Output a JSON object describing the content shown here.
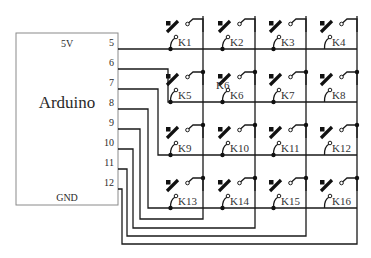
{
  "arduino": {
    "title": "Arduino",
    "top_label": "5V",
    "bottom_label": "GND",
    "box": {
      "x": 16,
      "y": 33,
      "w": 102,
      "h": 172
    },
    "pins": [
      {
        "label": "5",
        "y": 49
      },
      {
        "label": "6",
        "y": 69
      },
      {
        "label": "7",
        "y": 89
      },
      {
        "label": "8",
        "y": 109
      },
      {
        "label": "9",
        "y": 129
      },
      {
        "label": "10",
        "y": 149
      },
      {
        "label": "11",
        "y": 169
      },
      {
        "label": "12",
        "y": 189
      }
    ]
  },
  "matrix": {
    "rows_y": [
      49,
      102,
      155,
      208
    ],
    "cols_x": [
      203,
      255,
      306,
      357
    ],
    "col_top_y": 16,
    "row_pins": [
      "5",
      "6",
      "7",
      "8"
    ],
    "col_pins": [
      "9",
      "10",
      "11",
      "12"
    ]
  },
  "wiring": {
    "row_paths": [
      "M118 49 L357 49",
      "M118 69 L168 69 L168 102 L357 102",
      "M118 89 L158 89 L158 155 L357 155",
      "M118 109 L148 109 L148 208 L357 208"
    ],
    "col_paths": [
      "M118 129 L140 129 L140 219 L203 219 L203 16",
      "M118 149 L133 149 L133 228 L255 228 L255 16",
      "M118 169 L127 169 L127 236 L306 236 L306 16",
      "M118 189 L122 189 L122 244 L357 244 L357 16"
    ]
  },
  "keys": [
    {
      "label": "K1",
      "row": 0,
      "col": 0
    },
    {
      "label": "K2",
      "row": 0,
      "col": 1
    },
    {
      "label": "K3",
      "row": 0,
      "col": 2
    },
    {
      "label": "K4",
      "row": 0,
      "col": 3
    },
    {
      "label": "K5",
      "row": 1,
      "col": 0
    },
    {
      "label": "K6",
      "row": 1,
      "col": 1
    },
    {
      "label": "K7",
      "row": 1,
      "col": 2
    },
    {
      "label": "K8",
      "row": 1,
      "col": 3
    },
    {
      "label": "K9",
      "row": 2,
      "col": 0
    },
    {
      "label": "K10",
      "row": 2,
      "col": 1
    },
    {
      "label": "K11",
      "row": 2,
      "col": 2
    },
    {
      "label": "K12",
      "row": 2,
      "col": 3
    },
    {
      "label": "K13",
      "row": 3,
      "col": 0
    },
    {
      "label": "K14",
      "row": 3,
      "col": 1
    },
    {
      "label": "K15",
      "row": 3,
      "col": 2
    },
    {
      "label": "K16",
      "row": 3,
      "col": 3
    }
  ],
  "stray_label": {
    "text": "K6",
    "x": 216,
    "y": 89
  }
}
